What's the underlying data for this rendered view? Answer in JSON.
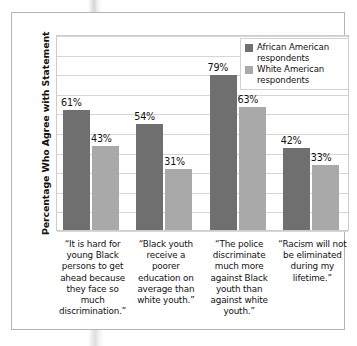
{
  "chart_data": {
    "type": "bar",
    "title": "",
    "xlabel": "",
    "ylabel": "Percentage Who Agree with Statement",
    "ylim": [
      0,
      100
    ],
    "grid": true,
    "legend_position": "top-right",
    "categories": [
      "“It is hard for young Black persons to get ahead because they face so much discrimination.”",
      "“Black youth receive a poorer education on average than white youth.”",
      "“The police discriminate much more against Black youth than against white youth.”",
      "“Racism will not be eliminated during my lifetime.”"
    ],
    "series": [
      {
        "name": "African American respondents",
        "color": "#6f6f6f",
        "values": [
          61,
          54,
          79,
          42
        ],
        "value_labels": [
          "61%",
          "54%",
          "79%",
          "42%"
        ]
      },
      {
        "name": "White American respondents",
        "color": "#a9a9a9",
        "values": [
          43,
          31,
          63,
          33
        ],
        "value_labels": [
          "43%",
          "31%",
          "63%",
          "33%"
        ]
      }
    ]
  },
  "legend": {
    "items": [
      {
        "label_line1": "African American",
        "label_line2": "respondents",
        "color": "#6f6f6f"
      },
      {
        "label_line1": "White American",
        "label_line2": "respondents",
        "color": "#a9a9a9"
      }
    ]
  },
  "axis": {
    "y_title": "Percentage Who Agree with Statement"
  }
}
